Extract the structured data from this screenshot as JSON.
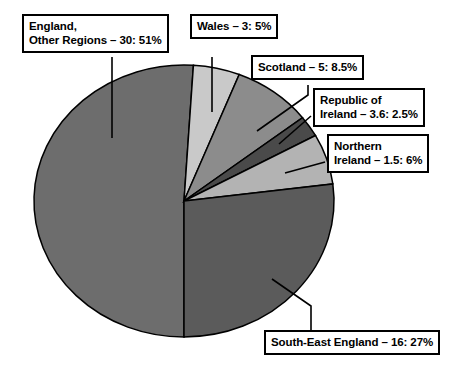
{
  "chart_data": {
    "type": "pie",
    "title": "",
    "subtitle": "",
    "xlabel": "",
    "ylabel": "",
    "legend_position": "callout-labels",
    "grid": false,
    "total_percent": 100,
    "categories": [
      "England, Other Regions",
      "Wales",
      "Scotland",
      "Republic of Ireland",
      "Northern Ireland",
      "South-East England"
    ],
    "values": [
      51,
      5,
      8.5,
      2.5,
      6,
      27
    ],
    "counts": [
      30,
      3,
      5,
      3.6,
      1.5,
      16
    ],
    "slices": [
      {
        "name": "England, Other Regions",
        "label": "England,\nOther Regions – 30: 51%",
        "label_line1": "England,",
        "label_line2": "Other Regions – 30: 51%",
        "count": 30,
        "percent": 51,
        "color": "#6d6d6d",
        "start_angle": 90,
        "end_angle": 273.6
      },
      {
        "name": "Wales",
        "label": "Wales – 3: 5%",
        "label_line1": "Wales – 3: 5%",
        "label_line2": "",
        "count": 3,
        "percent": 5,
        "color": "#c9c9c9",
        "start_angle": 273.6,
        "end_angle": 291.6
      },
      {
        "name": "Scotland",
        "label": "Scotland – 5: 8.5%",
        "label_line1": "Scotland – 5: 8.5%",
        "label_line2": "",
        "count": 5,
        "percent": 8.5,
        "color": "#8c8c8c",
        "start_angle": 291.6,
        "end_angle": 322.2
      },
      {
        "name": "Republic of Ireland",
        "label": "Republic of\nIreland – 3.6: 2.5%",
        "label_line1": "Republic of",
        "label_line2": "Ireland – 3.6: 2.5%",
        "count": 3.6,
        "percent": 2.5,
        "color": "#4a4a4a",
        "start_angle": 322.2,
        "end_angle": 331.2
      },
      {
        "name": "Northern Ireland",
        "label": "Northern\nIreland – 1.5: 6%",
        "label_line1": "Northern",
        "label_line2": "Ireland – 1.5: 6%",
        "count": 1.5,
        "percent": 6,
        "color": "#b3b3b3",
        "start_angle": 331.2,
        "end_angle": 352.8
      },
      {
        "name": "South-East England",
        "label": "South-East England – 16: 27%",
        "label_line1": "South-East England – 16: 27%",
        "label_line2": "",
        "count": 16,
        "percent": 27,
        "color": "#5b5b5b",
        "start_angle": 352.8,
        "end_angle": 450
      }
    ]
  },
  "colors": {
    "background": "#ffffff",
    "outline": "#000000",
    "text": "#000000",
    "england_other": "#6d6d6d",
    "wales": "#c9c9c9",
    "scotland": "#8c8c8c",
    "republic_of_ireland": "#4a4a4a",
    "northern_ireland": "#b3b3b3",
    "south_east_england": "#5b5b5b"
  },
  "labels": {
    "england": {
      "line1": "England,",
      "line2": "Other Regions – 30: 51%"
    },
    "wales": {
      "line1": "Wales – 3: 5%"
    },
    "scotland": {
      "line1": "Scotland – 5: 8.5%"
    },
    "republic_of_ireland": {
      "line1": "Republic of",
      "line2": "Ireland – 3.6: 2.5%"
    },
    "northern_ireland": {
      "line1": "Northern",
      "line2": "Ireland – 1.5: 6%"
    },
    "south_east_england": {
      "line1": "South-East England – 16: 27%"
    }
  }
}
